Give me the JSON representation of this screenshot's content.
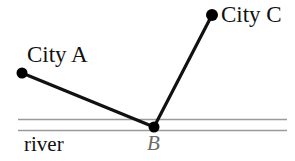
{
  "figure": {
    "background_color": "#ffffff",
    "width": 295,
    "height": 161,
    "labels": {
      "city_a": "City A",
      "city_c": "City C",
      "river": "river",
      "point_b": "B"
    },
    "colors": {
      "path_stroke": "#111111",
      "point_fill": "#000000",
      "river_stroke": "#9a9a9a",
      "point_b_label": "#6b6b6b"
    },
    "points": {
      "a": {
        "name": "City A",
        "x": 22,
        "y": 73,
        "radius": 5.5
      },
      "b": {
        "name": "B",
        "x": 154,
        "y": 127,
        "radius": 5.5
      },
      "c": {
        "name": "City C",
        "x": 212,
        "y": 15,
        "radius": 6
      }
    },
    "segments": [
      {
        "name": "segment-a-b",
        "from": "a",
        "to": "b",
        "x1": 22,
        "y1": 73,
        "x2": 154,
        "y2": 127,
        "stroke_width": 3.2
      },
      {
        "name": "segment-b-c",
        "from": "b",
        "to": "c",
        "x1": 154,
        "y1": 127,
        "x2": 212,
        "y2": 15,
        "stroke_width": 3.2
      }
    ],
    "river": {
      "label": "river",
      "x_start": 18,
      "x_end": 287,
      "top_line_y": 119.5,
      "bottom_line_y": 130.5,
      "stroke_width": 1.6
    }
  }
}
